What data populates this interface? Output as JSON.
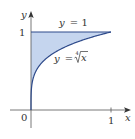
{
  "chart_data": {
    "type": "area",
    "title": "",
    "xlabel": "x",
    "ylabel": "y",
    "xlim": [
      0,
      1
    ],
    "ylim": [
      0,
      1
    ],
    "grid": false,
    "origin_label": "0",
    "x_ticks": [
      {
        "value": 1,
        "label": "1"
      }
    ],
    "y_ticks": [
      {
        "value": 1,
        "label": "1"
      }
    ],
    "series": [
      {
        "name": "y = 1",
        "kind": "line",
        "x": [
          0,
          1
        ],
        "y": [
          1,
          1
        ]
      },
      {
        "name": "y = ⁴√x",
        "kind": "curve",
        "function": "x^(1/4)",
        "x": [
          0,
          0.01,
          0.05,
          0.1,
          0.2,
          0.3,
          0.4,
          0.5,
          0.6,
          0.7,
          0.8,
          0.9,
          1
        ],
        "y": [
          0,
          0.316,
          0.473,
          0.562,
          0.669,
          0.74,
          0.795,
          0.841,
          0.88,
          0.915,
          0.946,
          0.974,
          1
        ]
      }
    ],
    "shaded_region": {
      "between": [
        "y = ⁴√x",
        "y = 1"
      ],
      "x_range": [
        0,
        1
      ]
    },
    "annotations": [
      {
        "text": "y = 1",
        "near": "top line"
      },
      {
        "text": "y = ⁴√x",
        "near": "curve"
      }
    ]
  },
  "labels": {
    "y_axis": "y",
    "x_axis": "x",
    "origin": "0",
    "x_tick_1": "1",
    "y_tick_1": "1",
    "line_label_y": "y",
    "line_label_eq": "= 1",
    "curve_label_y": "y",
    "curve_label_eq": "=",
    "curve_root_index": "4",
    "curve_radicand": "x"
  },
  "colors": {
    "fill": "#c5d5ee",
    "curve": "#2e4a8a",
    "line": "#2e4a8a",
    "axis": "#555555"
  }
}
